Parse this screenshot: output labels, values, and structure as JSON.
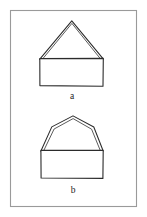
{
  "page": {
    "background_color": "#ffffff",
    "width": 147,
    "height": 217
  },
  "frame": {
    "name": "figure-border",
    "stroke_color": "#9a9a9a",
    "x": 10,
    "y": 10,
    "width": 127,
    "height": 197
  },
  "figures": [
    {
      "id": "a",
      "label": "a",
      "description": "gabled house outline: tall triangular roof on a wide rectangle",
      "label_x": 72,
      "label_y": 99,
      "stroke_color": "#2b2b2b",
      "roof": {
        "type": "triangle",
        "apex": [
          72,
          21
        ],
        "left_eave": [
          40,
          59
        ],
        "right_eave": [
          103,
          59
        ],
        "double_line_offset": 2.2
      },
      "body": {
        "type": "rectangle",
        "x": 40,
        "y": 58,
        "width": 63,
        "height": 28
      }
    },
    {
      "id": "b",
      "label": "b",
      "description": "arched house outline: domed polygonal roof with shoulder bends on a wide rectangle",
      "label_x": 73,
      "label_y": 193,
      "stroke_color": "#2b2b2b",
      "roof": {
        "type": "polygon-arch",
        "apex": [
          73,
          116
        ],
        "left_shoulder": [
          52,
          127
        ],
        "right_shoulder": [
          94,
          127
        ],
        "left_eave": [
          41,
          151
        ],
        "right_eave": [
          103,
          151
        ],
        "double_line_offset": 2.2
      },
      "body": {
        "type": "rectangle",
        "x": 41,
        "y": 150,
        "width": 62,
        "height": 28
      }
    }
  ],
  "colors": {
    "ink": "#2b2b2b",
    "frame": "#9a9a9a",
    "paper": "#ffffff"
  }
}
